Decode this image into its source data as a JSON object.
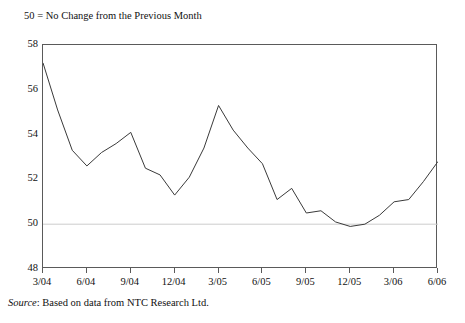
{
  "note": "50 = No Change from the Previous Month",
  "source": {
    "label": "Source",
    "separator": ": ",
    "text": "Based on data from NTC Research Ltd."
  },
  "chart_data": {
    "type": "line",
    "title": "",
    "subtitle": "50 = No Change from the Previous Month",
    "xlabel": "",
    "ylabel": "",
    "ylim": [
      48,
      58
    ],
    "yticks": [
      48,
      50,
      52,
      54,
      56,
      58
    ],
    "xlim": [
      "3/04",
      "6/06"
    ],
    "xticks": [
      "3/04",
      "6/04",
      "9/04",
      "12/04",
      "3/05",
      "6/05",
      "9/05",
      "12/05",
      "3/06",
      "6/06"
    ],
    "grid": false,
    "reference_line": {
      "value": 50,
      "label": "50 = No Change from the Previous Month",
      "color": "#cccccc"
    },
    "legend": null,
    "line_color": "#3a3a3a",
    "axis_color": "#5a5a5a",
    "x": [
      "3/04",
      "4/04",
      "5/04",
      "6/04",
      "7/04",
      "8/04",
      "9/04",
      "10/04",
      "11/04",
      "12/04",
      "1/05",
      "2/05",
      "3/05",
      "4/05",
      "5/05",
      "6/05",
      "7/05",
      "8/05",
      "9/05",
      "10/05",
      "11/05",
      "12/05",
      "1/06",
      "2/06",
      "3/06",
      "4/06",
      "5/06",
      "6/06"
    ],
    "values": [
      57.2,
      55.1,
      53.3,
      52.6,
      53.2,
      53.6,
      54.1,
      52.5,
      52.2,
      51.3,
      52.1,
      53.4,
      55.3,
      54.2,
      53.4,
      52.7,
      51.1,
      51.6,
      50.5,
      50.6,
      50.1,
      49.9,
      50.0,
      50.4,
      51.0,
      51.1,
      51.9,
      52.8
    ]
  }
}
